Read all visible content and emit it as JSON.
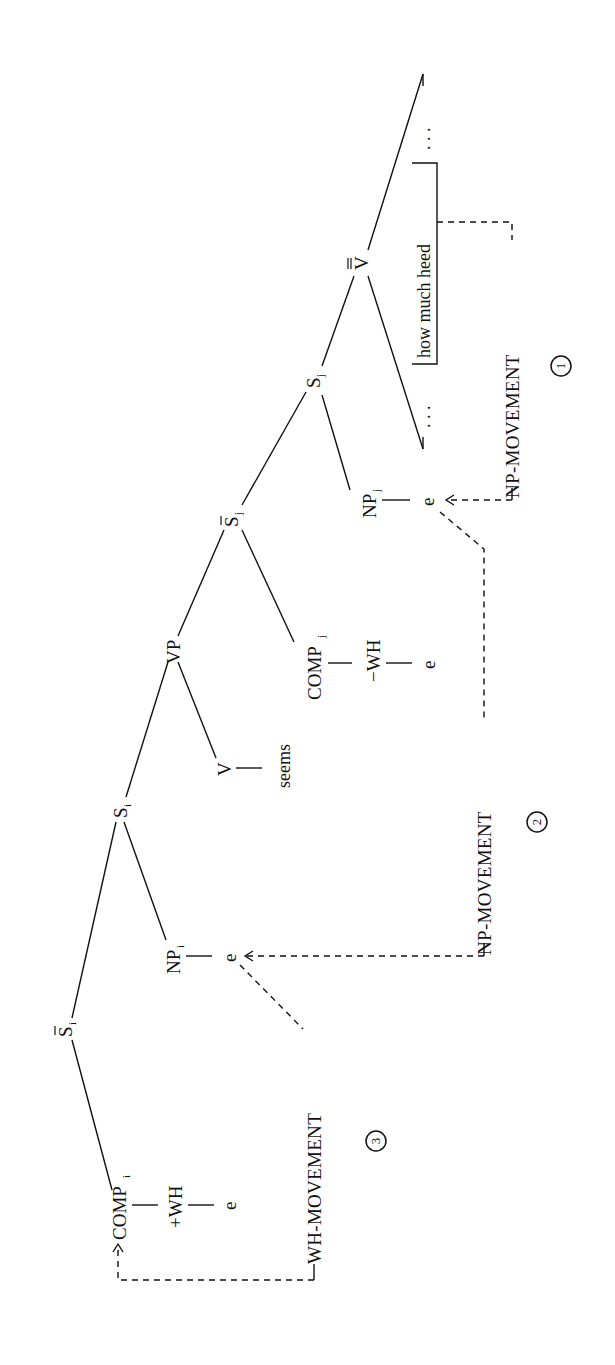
{
  "diagram": {
    "orientation": "rotated-90-ccw",
    "nodes": {
      "sbar_i": {
        "label": "S",
        "bar": "single",
        "sub": "i"
      },
      "comp_i": {
        "label": "COMP",
        "sub": "i"
      },
      "plus_wh": {
        "label": "+WH"
      },
      "e_comp_i": {
        "label": "e"
      },
      "s_i": {
        "label": "S",
        "sub": "i"
      },
      "np_i": {
        "label": "NP",
        "sub": "i"
      },
      "e_np_i": {
        "label": "e"
      },
      "vp": {
        "label": "VP"
      },
      "v": {
        "label": "V"
      },
      "seems": {
        "label": "seems"
      },
      "sbar_j": {
        "label": "S",
        "bar": "single",
        "sub": "j"
      },
      "comp_j": {
        "label": "COMP",
        "sub": "j"
      },
      "minus_wh": {
        "label": "−WH"
      },
      "e_comp_j": {
        "label": "e"
      },
      "s_j": {
        "label": "S",
        "sub": "j"
      },
      "np_j": {
        "label": "NP",
        "sub": "j"
      },
      "e_np_j": {
        "label": "e"
      },
      "vbarbar": {
        "label": "V",
        "bar": "double"
      },
      "phrase": {
        "label": "how much heed"
      },
      "ellipsis": {
        "label": ". . ."
      }
    },
    "movements": [
      {
        "step": "1",
        "label": "NP-MOVEMENT",
        "from": "how much heed",
        "to": "NP_j e"
      },
      {
        "step": "2",
        "label": "NP-MOVEMENT",
        "from": "NP_j e",
        "to": "NP_i e"
      },
      {
        "step": "3",
        "label": "WH-MOVEMENT",
        "from": "NP_i e",
        "to": "COMP_i"
      }
    ]
  }
}
